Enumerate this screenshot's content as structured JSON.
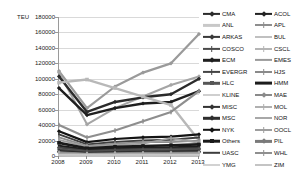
{
  "axis": {
    "y_axis_title": "TEU",
    "y_ticks": [
      "180000",
      "160000",
      "140000",
      "120000",
      "100000",
      "80000",
      "60000",
      "40000",
      "20000",
      "0"
    ],
    "x_ticks": [
      "2008",
      "2009",
      "2010",
      "2011",
      "2012",
      "2013"
    ]
  },
  "colors": {
    "gridline": "#d9d9d9",
    "axis": "#8c8c8c",
    "text": "#1a1a1a"
  },
  "legend": {
    "column1": [
      {
        "label": "CMA",
        "color": "#2b2b2b",
        "marker": "diamond",
        "width": 2.2
      },
      {
        "label": "ANL",
        "color": "#c8c8c8",
        "marker": "none",
        "width": 2.2
      },
      {
        "label": "ARKAS",
        "color": "#3a3a3a",
        "marker": "diamond",
        "width": 2.2
      },
      {
        "label": "COSCO",
        "color": "#4a4a4a",
        "marker": "bar",
        "width": 2.2
      },
      {
        "label": "ECM",
        "color": "#1f1f1f",
        "marker": "diamond",
        "width": 2.4
      },
      {
        "label": "EVERGR",
        "color": "#444444",
        "marker": "bar",
        "width": 2.2
      },
      {
        "label": "HLC",
        "color": "#565656",
        "marker": "square",
        "width": 2.4
      },
      {
        "label": "KLINE",
        "color": "#cfcfcf",
        "marker": "none",
        "width": 2.0
      },
      {
        "label": "MISC",
        "color": "#333333",
        "marker": "diamond",
        "width": 2.2
      },
      {
        "label": "MSC",
        "color": "#2e2e2e",
        "marker": "diamond",
        "width": 2.4
      },
      {
        "label": "NYK",
        "color": "#141414",
        "marker": "diamond",
        "width": 2.4
      },
      {
        "label": "Others",
        "color": "#1a1a1a",
        "marker": "square",
        "width": 2.6
      },
      {
        "label": "UASC",
        "color": "#3d3d3d",
        "marker": "none",
        "width": 2.4
      },
      {
        "label": "YMG",
        "color": "#d2d2d2",
        "marker": "none",
        "width": 2.0
      }
    ],
    "column2": [
      {
        "label": "ACOL",
        "color": "#222222",
        "marker": "diamond",
        "width": 2.2
      },
      {
        "label": "APL",
        "color": "#8e8e8e",
        "marker": "bar",
        "width": 2.0
      },
      {
        "label": "BUL",
        "color": "#c0c0c0",
        "marker": "none",
        "width": 2.0
      },
      {
        "label": "CSCL",
        "color": "#b5b5b5",
        "marker": "bar",
        "width": 2.0
      },
      {
        "label": "EMES",
        "color": "#9a9a9a",
        "marker": "none",
        "width": 2.2
      },
      {
        "label": "HJS",
        "color": "#8a8a8a",
        "marker": "bar",
        "width": 2.0
      },
      {
        "label": "HMM",
        "color": "#1c1c1c",
        "marker": "none",
        "width": 2.8
      },
      {
        "label": "MAE",
        "color": "#8a8a8a",
        "marker": "diamond",
        "width": 2.0
      },
      {
        "label": "MOL",
        "color": "#b0b0b0",
        "marker": "bar",
        "width": 2.0
      },
      {
        "label": "NOR",
        "color": "#a8a8a8",
        "marker": "none",
        "width": 2.0
      },
      {
        "label": "OOCL",
        "color": "#9e9e9e",
        "marker": "bar",
        "width": 2.0
      },
      {
        "label": "PIL",
        "color": "#7a7a7a",
        "marker": "diamond",
        "width": 2.2
      },
      {
        "label": "WHL",
        "color": "#8f8f8f",
        "marker": "bar",
        "width": 2.0
      },
      {
        "label": "ZIM",
        "color": "#c4c4c4",
        "marker": "none",
        "width": 2.0
      }
    ]
  },
  "chart_data": {
    "type": "line",
    "title": "",
    "xlabel": "",
    "ylabel": "TEU",
    "ylim": [
      0,
      180000
    ],
    "ytick_step": 20000,
    "grid": true,
    "legend_position": "right",
    "x": [
      "2008",
      "2009",
      "2010",
      "2011",
      "2012",
      "2013"
    ],
    "series": [
      {
        "name": "MSC",
        "color": "#9a9a9a",
        "marker": "diamond",
        "width": 2.2,
        "values": [
          110000,
          62000,
          90000,
          108000,
          120000,
          158000
        ]
      },
      {
        "name": "MAE",
        "color": "#a5a5a5",
        "marker": "diamond",
        "width": 2.0,
        "values": [
          108000,
          41000,
          62000,
          77000,
          92000,
          103000
        ]
      },
      {
        "name": "CMA",
        "color": "#2b2b2b",
        "marker": "diamond",
        "width": 2.4,
        "values": [
          103000,
          57000,
          70000,
          76000,
          80000,
          100000
        ]
      },
      {
        "name": "ECM",
        "color": "#1f1f1f",
        "marker": "diamond",
        "width": 2.4,
        "values": [
          88000,
          53000,
          62000,
          68000,
          70000,
          84000
        ]
      },
      {
        "name": "HLC",
        "color": "#b8b8b8",
        "marker": "square",
        "width": 2.4,
        "values": [
          95000,
          99000,
          88000,
          77000,
          66000,
          20000
        ]
      },
      {
        "name": "EVERGR",
        "color": "#8e8e8e",
        "marker": "bar",
        "width": 2.2,
        "values": [
          40000,
          24000,
          33000,
          45000,
          57000,
          84000
        ]
      },
      {
        "name": "NYK",
        "color": "#141414",
        "marker": "diamond",
        "width": 2.2,
        "values": [
          32000,
          18000,
          22000,
          24000,
          25000,
          28000
        ]
      },
      {
        "name": "COSCO",
        "color": "#3f3f3f",
        "marker": "bar",
        "width": 2.0,
        "values": [
          28000,
          15000,
          18000,
          20000,
          21000,
          24000
        ]
      },
      {
        "name": "APL",
        "color": "#8e8e8e",
        "marker": "bar",
        "width": 1.8,
        "values": [
          24000,
          13000,
          16000,
          18000,
          18000,
          20000
        ]
      },
      {
        "name": "OOCL",
        "color": "#9e9e9e",
        "marker": "bar",
        "width": 1.8,
        "values": [
          21000,
          12000,
          14000,
          16000,
          23000,
          17000
        ]
      },
      {
        "name": "Others",
        "color": "#1a1a1a",
        "marker": "square",
        "width": 2.6,
        "values": [
          17000,
          10000,
          12000,
          13000,
          14000,
          15000
        ]
      },
      {
        "name": "HMM",
        "color": "#1c1c1c",
        "marker": "none",
        "width": 2.6,
        "values": [
          13000,
          8000,
          9500,
          10500,
          11000,
          12000
        ]
      },
      {
        "name": "MISC",
        "color": "#444444",
        "marker": "diamond",
        "width": 2.0,
        "values": [
          11000,
          6500,
          8000,
          9000,
          9500,
          10000
        ]
      },
      {
        "name": "ARKAS",
        "color": "#555555",
        "marker": "diamond",
        "width": 1.8,
        "values": [
          9000,
          5500,
          6500,
          7500,
          8000,
          8500
        ]
      },
      {
        "name": "UASC",
        "color": "#3d3d3d",
        "marker": "none",
        "width": 2.0,
        "values": [
          7500,
          4500,
          5500,
          6000,
          6500,
          7000
        ]
      },
      {
        "name": "ACOL",
        "color": "#222222",
        "marker": "diamond",
        "width": 1.8,
        "values": [
          6000,
          3800,
          4500,
          5000,
          5200,
          5800
        ]
      },
      {
        "name": "PIL",
        "color": "#7a7a7a",
        "marker": "diamond",
        "width": 1.8,
        "values": [
          5000,
          3200,
          3800,
          4200,
          4400,
          4800
        ]
      },
      {
        "name": "WHL",
        "color": "#8f8f8f",
        "marker": "bar",
        "width": 1.8,
        "values": [
          4200,
          2800,
          3200,
          3600,
          3800,
          4000
        ]
      },
      {
        "name": "HJS",
        "color": "#8a8a8a",
        "marker": "bar",
        "width": 1.8,
        "values": [
          3600,
          2400,
          2800,
          3000,
          3200,
          3400
        ]
      },
      {
        "name": "CSCL",
        "color": "#b5b5b5",
        "marker": "bar",
        "width": 1.8,
        "values": [
          3000,
          2000,
          2400,
          2600,
          2800,
          3000
        ]
      },
      {
        "name": "MOL",
        "color": "#b0b0b0",
        "marker": "bar",
        "width": 1.8,
        "values": [
          2500,
          1700,
          2000,
          2200,
          2400,
          2600
        ]
      },
      {
        "name": "EMES",
        "color": "#9a9a9a",
        "marker": "none",
        "width": 1.8,
        "values": [
          2100,
          1400,
          1700,
          1900,
          2000,
          2200
        ]
      },
      {
        "name": "NOR",
        "color": "#a8a8a8",
        "marker": "none",
        "width": 1.8,
        "values": [
          1700,
          1200,
          1400,
          1500,
          1600,
          1800
        ]
      },
      {
        "name": "ANL",
        "color": "#c8c8c8",
        "marker": "none",
        "width": 1.8,
        "values": [
          1400,
          950,
          1150,
          1250,
          1350,
          1450
        ]
      },
      {
        "name": "KLINE",
        "color": "#cfcfcf",
        "marker": "none",
        "width": 1.8,
        "values": [
          1100,
          750,
          900,
          1000,
          1050,
          1150
        ]
      },
      {
        "name": "BUL",
        "color": "#c0c0c0",
        "marker": "none",
        "width": 1.8,
        "values": [
          850,
          600,
          700,
          780,
          820,
          900
        ]
      },
      {
        "name": "YMG",
        "color": "#d2d2d2",
        "marker": "none",
        "width": 1.8,
        "values": [
          600,
          420,
          500,
          550,
          580,
          640
        ]
      },
      {
        "name": "ZIM",
        "color": "#c4c4c4",
        "marker": "none",
        "width": 1.8,
        "values": [
          380,
          260,
          310,
          350,
          370,
          400
        ]
      }
    ]
  }
}
